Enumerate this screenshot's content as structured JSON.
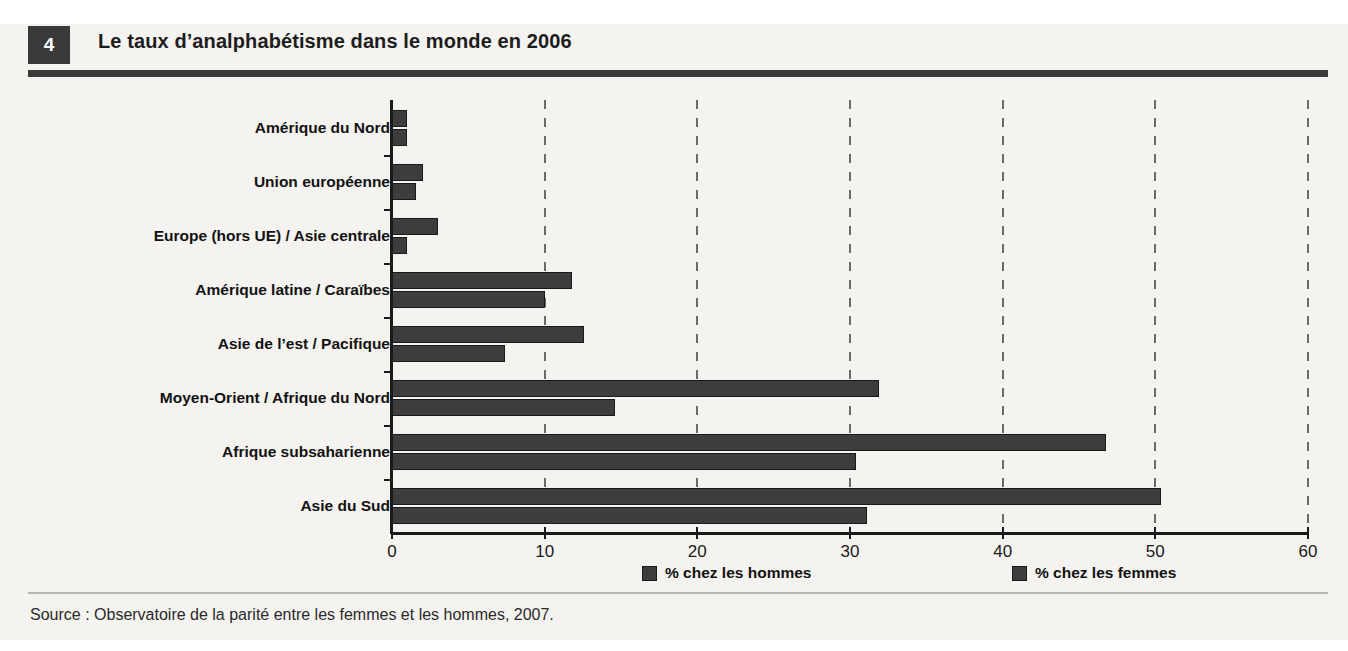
{
  "header": {
    "number": "4",
    "title": "Le taux d’analphabétisme dans le monde en 2006"
  },
  "source": {
    "text": "Source : Observatoire de la parité entre les femmes et les hommes, 2007."
  },
  "colors": {
    "bar": "#3d3d3d",
    "bar_outline": "#1a1a1a",
    "panel_background": "#f4f3f0",
    "header_block": "#3a3a3a",
    "text": "#121212"
  },
  "legend": {
    "items": [
      {
        "label": "% chez les hommes",
        "key": "hommes"
      },
      {
        "label": "% chez les femmes",
        "key": "femmes"
      }
    ]
  },
  "axis": {
    "ticks": [
      "0",
      "10",
      "20",
      "30",
      "40",
      "50",
      "60"
    ]
  },
  "chart_data": {
    "type": "bar",
    "orientation": "horizontal",
    "title": "Le taux d’analphabétisme dans le monde en 2006",
    "xlabel": "",
    "ylabel": "",
    "xlim": [
      0,
      60
    ],
    "xticks": [
      0,
      10,
      20,
      30,
      40,
      50,
      60
    ],
    "grid": true,
    "grid_style": "dashed-vertical",
    "legend_position": "bottom",
    "categories": [
      "Amérique du Nord",
      "Union européenne",
      "Europe (hors UE) / Asie centrale",
      "Amérique latine / Caraïbes",
      "Asie de l’est / Pacifique",
      "Moyen-Orient / Afrique du Nord",
      "Afrique subsaharienne",
      "Asie du Sud"
    ],
    "series": [
      {
        "name": "% chez les hommes",
        "values": [
          1.0,
          2.0,
          3.0,
          11.8,
          12.6,
          31.9,
          46.8,
          50.4
        ]
      },
      {
        "name": "% chez les femmes",
        "values": [
          1.0,
          1.6,
          1.0,
          10.0,
          7.4,
          14.6,
          30.4,
          31.1
        ]
      }
    ],
    "source": "Source : Observatoire de la parité entre les femmes et les hommes, 2007."
  }
}
